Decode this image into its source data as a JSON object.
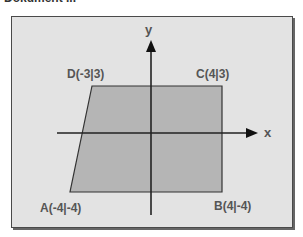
{
  "header": {
    "partial_title": "Dokument ..."
  },
  "diagram": {
    "axes": {
      "x_label": "x",
      "y_label": "y"
    },
    "points": {
      "A": {
        "label": "A(-4|-4)"
      },
      "B": {
        "label": "B(4|-4)"
      },
      "C": {
        "label": "C(4|3)"
      },
      "D": {
        "label": "D(-3|3)"
      }
    },
    "colors": {
      "background": "#e3e3e3",
      "shape_fill": "#b5b5b5",
      "axis": "#222222",
      "label": "#555555"
    }
  }
}
